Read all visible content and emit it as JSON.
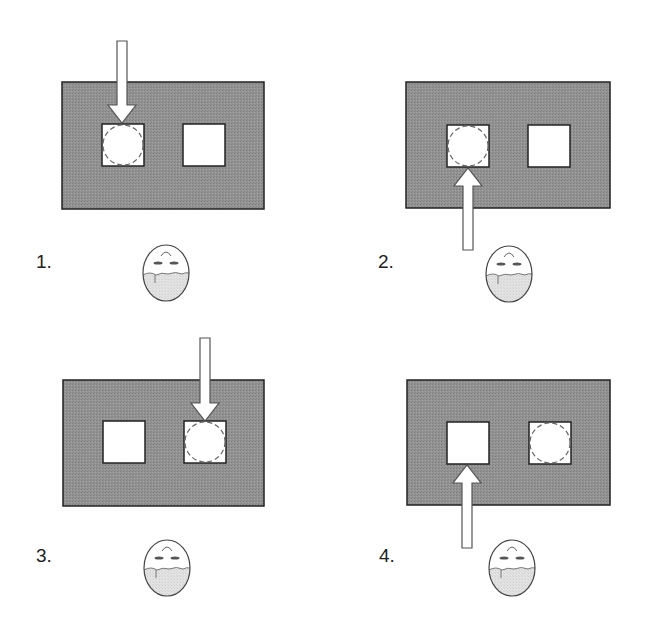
{
  "colors": {
    "board_fill": "#8f8f8f",
    "board_stroke": "#222222",
    "hole_fill": "#ffffff",
    "target_circle_stroke": "#666666",
    "arrow_fill": "#ffffff",
    "arrow_stroke": "#555555",
    "face_stroke": "#444444",
    "face_lower_fill": "#dcdcdc",
    "label_color": "#222222"
  },
  "panels": [
    {
      "label": "1.",
      "board": {
        "x": 62,
        "y": 82,
        "w": 202,
        "h": 127
      },
      "holes": [
        {
          "x": 102,
          "y": 124,
          "s": 42
        },
        {
          "x": 183,
          "y": 124,
          "s": 42
        }
      ],
      "target_hole": 0,
      "arrow": {
        "direction": "down",
        "cx": 122,
        "tail": 41,
        "tip": 123
      },
      "face": {
        "cx": 166,
        "cy": 273
      },
      "label_pos": {
        "x": 36,
        "y": 268
      }
    },
    {
      "label": "2.",
      "board": {
        "x": 406,
        "y": 82,
        "w": 204,
        "h": 126
      },
      "holes": [
        {
          "x": 447,
          "y": 125,
          "s": 42
        },
        {
          "x": 528,
          "y": 125,
          "s": 42
        }
      ],
      "target_hole": 0,
      "arrow": {
        "direction": "up",
        "cx": 468,
        "tail": 250,
        "tip": 168
      },
      "face": {
        "cx": 509,
        "cy": 274
      },
      "label_pos": {
        "x": 378,
        "y": 268
      }
    },
    {
      "label": "3.",
      "board": {
        "x": 63,
        "y": 380,
        "w": 201,
        "h": 126
      },
      "holes": [
        {
          "x": 103,
          "y": 421,
          "s": 42
        },
        {
          "x": 184,
          "y": 421,
          "s": 42
        }
      ],
      "target_hole": 1,
      "arrow": {
        "direction": "down",
        "cx": 205,
        "tail": 338,
        "tip": 421
      },
      "face": {
        "cx": 167,
        "cy": 568
      },
      "label_pos": {
        "x": 36,
        "y": 562
      }
    },
    {
      "label": "4.",
      "board": {
        "x": 407,
        "y": 380,
        "w": 203,
        "h": 125
      },
      "holes": [
        {
          "x": 447,
          "y": 422,
          "s": 42
        },
        {
          "x": 529,
          "y": 422,
          "s": 42
        }
      ],
      "target_hole": 1,
      "arrow": {
        "direction": "up",
        "cx": 467,
        "tail": 548,
        "tip": 465
      },
      "face": {
        "cx": 512,
        "cy": 568
      },
      "label_pos": {
        "x": 379,
        "y": 562
      }
    }
  ]
}
